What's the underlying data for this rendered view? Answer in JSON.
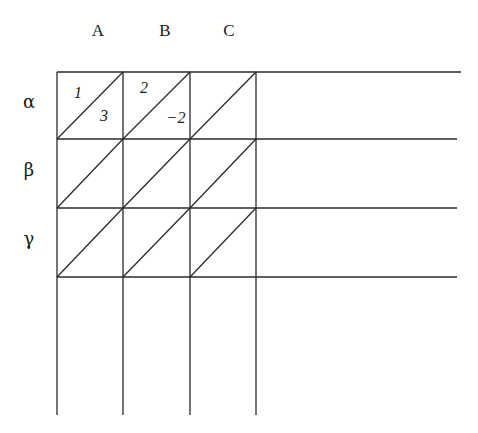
{
  "diagram": {
    "column_headers": [
      "A",
      "B",
      "C"
    ],
    "row_headers": [
      "α",
      "β",
      "γ"
    ],
    "cells": [
      [
        {
          "upper": "1",
          "lower": "3"
        },
        {
          "upper": "2",
          "lower": "−2"
        },
        {
          "upper": "",
          "lower": ""
        }
      ],
      [
        {
          "upper": "",
          "lower": ""
        },
        {
          "upper": "",
          "lower": ""
        },
        {
          "upper": "",
          "lower": ""
        }
      ],
      [
        {
          "upper": "",
          "lower": ""
        },
        {
          "upper": "",
          "lower": ""
        },
        {
          "upper": "",
          "lower": ""
        }
      ]
    ]
  }
}
